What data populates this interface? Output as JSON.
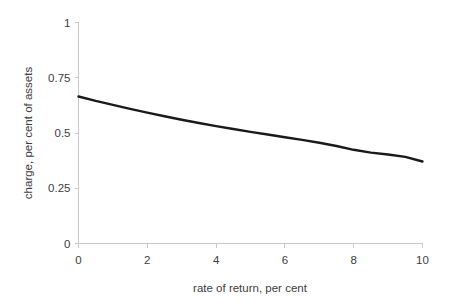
{
  "chart_data": {
    "type": "line",
    "title": "",
    "xlabel": "rate of return, per cent",
    "ylabel": "charge, per cent of assets",
    "xlim": [
      0,
      10
    ],
    "ylim": [
      0,
      1
    ],
    "xticks": [
      "0",
      "2",
      "4",
      "6",
      "8",
      "10"
    ],
    "xtick_values": [
      0,
      2,
      4,
      6,
      8,
      10
    ],
    "yticks": [
      "0",
      "0.25",
      "0.5",
      "0.75",
      "1"
    ],
    "ytick_values": [
      0,
      0.25,
      0.5,
      0.75,
      1
    ],
    "grid": false,
    "legend": "none",
    "line_color": "#1a1a1a",
    "axis_color": "#c9c9c9",
    "series": [
      {
        "name": "charge",
        "x": [
          0,
          0.5,
          1,
          1.5,
          2,
          2.5,
          3,
          3.5,
          4,
          4.5,
          5,
          5.5,
          6,
          6.5,
          7,
          7.5,
          8,
          8.5,
          9,
          9.5,
          10
        ],
        "values": [
          0.665,
          0.645,
          0.627,
          0.609,
          0.592,
          0.576,
          0.56,
          0.545,
          0.531,
          0.518,
          0.505,
          0.493,
          0.481,
          0.469,
          0.456,
          0.441,
          0.424,
          0.411,
          0.403,
          0.392,
          0.371
        ]
      }
    ]
  }
}
